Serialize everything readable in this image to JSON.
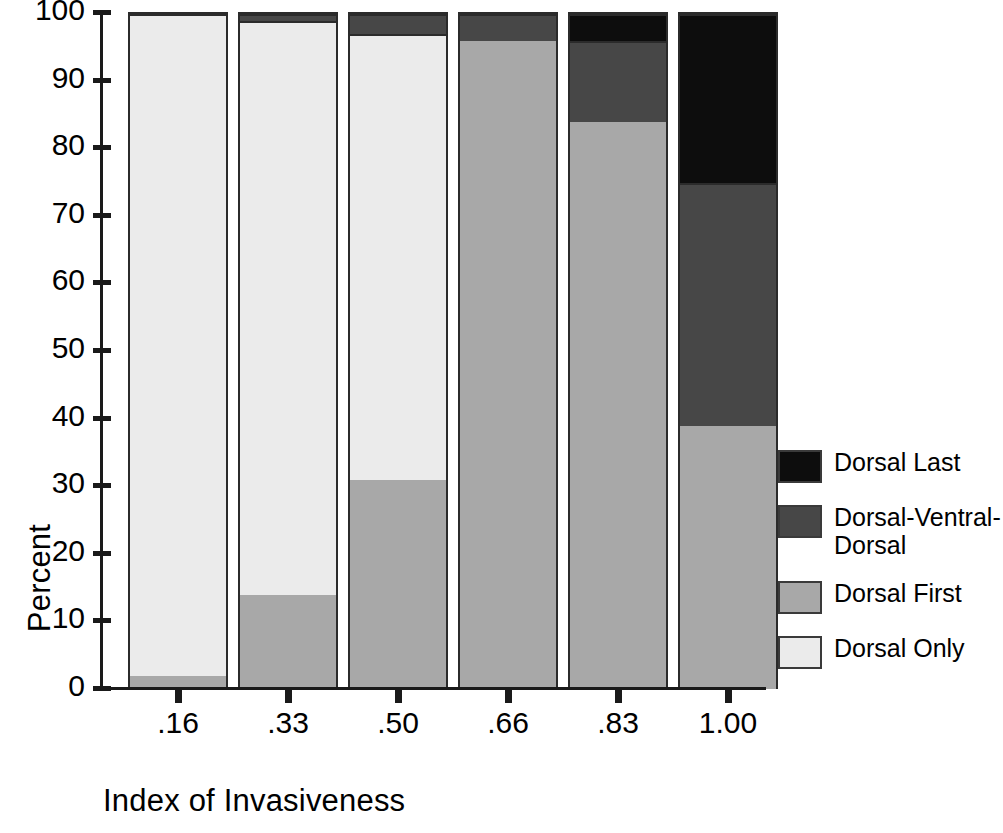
{
  "chart_data": {
    "type": "bar",
    "subtype": "stacked-percent",
    "title": "",
    "xlabel": "Index of Invasiveness",
    "ylabel": "Percent",
    "categories": [
      ".16",
      ".33",
      ".50",
      ".66",
      ".83",
      "1.00"
    ],
    "ylim": [
      0,
      100
    ],
    "yticks": [
      0,
      10,
      20,
      30,
      40,
      50,
      60,
      70,
      80,
      90,
      100
    ],
    "ytick_labels": [
      "0",
      "10",
      "20",
      "30",
      "40",
      "50",
      "60",
      "70",
      "80",
      "90",
      "100"
    ],
    "grid": false,
    "legend_position": "right",
    "stack_order_bottom_to_top": [
      "Dorsal First",
      "Dorsal Only",
      "Dorsal-Ventral-Dorsal",
      "Dorsal Last"
    ],
    "series": [
      {
        "name": "Dorsal Only",
        "color": "#ebebeb",
        "values": [
          98,
          85,
          66,
          0,
          0,
          0
        ]
      },
      {
        "name": "Dorsal First",
        "color": "#a8a8a8",
        "values": [
          2,
          14,
          31,
          96,
          84,
          39
        ]
      },
      {
        "name": "Dorsal-Ventral-Dorsal",
        "color": "#474747",
        "values": [
          0,
          1,
          3,
          4,
          12,
          36
        ]
      },
      {
        "name": "Dorsal Last",
        "color": "#0d0d0d",
        "values": [
          0,
          0,
          0,
          0,
          4,
          25
        ]
      }
    ],
    "bars": [
      {
        "category": ".16",
        "segments": [
          {
            "name": "Dorsal First",
            "value": 2,
            "color": "#a8a8a8"
          },
          {
            "name": "Dorsal Only",
            "value": 98,
            "color": "#ebebeb"
          }
        ]
      },
      {
        "category": ".33",
        "segments": [
          {
            "name": "Dorsal First",
            "value": 14,
            "color": "#a8a8a8"
          },
          {
            "name": "Dorsal Only",
            "value": 85,
            "color": "#ebebeb"
          },
          {
            "name": "Dorsal-Ventral-Dorsal",
            "value": 1,
            "color": "#474747"
          }
        ]
      },
      {
        "category": ".50",
        "segments": [
          {
            "name": "Dorsal First",
            "value": 31,
            "color": "#a8a8a8"
          },
          {
            "name": "Dorsal Only",
            "value": 66,
            "color": "#ebebeb"
          },
          {
            "name": "Dorsal-Ventral-Dorsal",
            "value": 3,
            "color": "#474747"
          }
        ]
      },
      {
        "category": ".66",
        "segments": [
          {
            "name": "Dorsal First",
            "value": 96,
            "color": "#a8a8a8"
          },
          {
            "name": "Dorsal-Ventral-Dorsal",
            "value": 4,
            "color": "#474747"
          }
        ]
      },
      {
        "category": ".83",
        "segments": [
          {
            "name": "Dorsal First",
            "value": 84,
            "color": "#a8a8a8"
          },
          {
            "name": "Dorsal-Ventral-Dorsal",
            "value": 12,
            "color": "#474747"
          },
          {
            "name": "Dorsal Last",
            "value": 4,
            "color": "#0d0d0d"
          }
        ]
      },
      {
        "category": "1.00",
        "segments": [
          {
            "name": "Dorsal First",
            "value": 39,
            "color": "#a8a8a8"
          },
          {
            "name": "Dorsal-Ventral-Dorsal",
            "value": 36,
            "color": "#474747"
          },
          {
            "name": "Dorsal Last",
            "value": 25,
            "color": "#0d0d0d"
          }
        ]
      }
    ],
    "legend": [
      {
        "label": "Dorsal Last",
        "color": "#0d0d0d"
      },
      {
        "label": "Dorsal-Ventral-\nDorsal",
        "color": "#474747"
      },
      {
        "label": "Dorsal First",
        "color": "#a8a8a8"
      },
      {
        "label": "Dorsal Only",
        "color": "#ebebeb"
      }
    ]
  },
  "axis_color": "#1a1a1a"
}
